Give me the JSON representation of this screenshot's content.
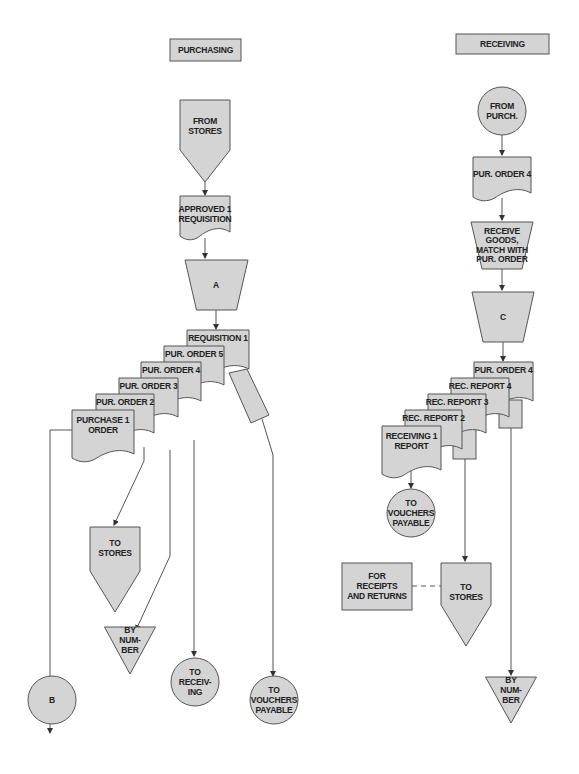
{
  "diagram": {
    "type": "document flowchart",
    "columns": {
      "purchasing": {
        "header": "PURCHASING",
        "from_stores": [
          "FROM",
          "STORES"
        ],
        "approved_requisition": [
          "APPROVED 1",
          "REQUISITION"
        ],
        "file_a": "A",
        "stack": [
          {
            "label": [
              "REQUISITION 1"
            ]
          },
          {
            "label": [
              "PUR. ORDER 5"
            ]
          },
          {
            "label": [
              "PUR. ORDER 4"
            ]
          },
          {
            "label": [
              "PUR. ORDER 3"
            ]
          },
          {
            "label": [
              "PUR. ORDER 2"
            ]
          },
          {
            "label": [
              "PURCHASE 1",
              "ORDER"
            ]
          }
        ],
        "to_stores": [
          "TO",
          "STORES"
        ],
        "by_number": [
          "BY",
          "NUM-",
          "BER"
        ],
        "to_receiving": [
          "TO",
          "RECEIV-",
          "ING"
        ],
        "to_vouchers": [
          "TO",
          "VOUCHERS",
          "PAYABLE"
        ],
        "connector_b": "B"
      },
      "receiving": {
        "header": "RECEIVING",
        "from_purch": [
          "FROM",
          "PURCH."
        ],
        "pur_order": [
          "PUR. ORDER 4"
        ],
        "receive_goods": [
          "RECEIVE",
          "GOODS,",
          "MATCH WITH",
          "PUR. ORDER"
        ],
        "file_c": "C",
        "stack": [
          {
            "label": [
              "PUR. ORDER 4"
            ]
          },
          {
            "label": [
              "REC. REPORT 4"
            ]
          },
          {
            "label": [
              "REC. REPORT 3"
            ]
          },
          {
            "label": [
              "REC. REPORT 2"
            ]
          },
          {
            "label": [
              "RECEIVING 1",
              "REPORT"
            ]
          }
        ],
        "to_vouchers": [
          "TO",
          "VOUCHERS",
          "PAYABLE"
        ],
        "for_receipts": [
          "FOR",
          "RECEIPTS",
          "AND RETURNS"
        ],
        "to_stores": [
          "TO",
          "STORES"
        ],
        "by_number": [
          "BY",
          "NUM-",
          "BER"
        ]
      }
    },
    "colors": {
      "shape_fill": "#d4d4d4",
      "stroke": "#555555",
      "text": "#222222"
    }
  }
}
